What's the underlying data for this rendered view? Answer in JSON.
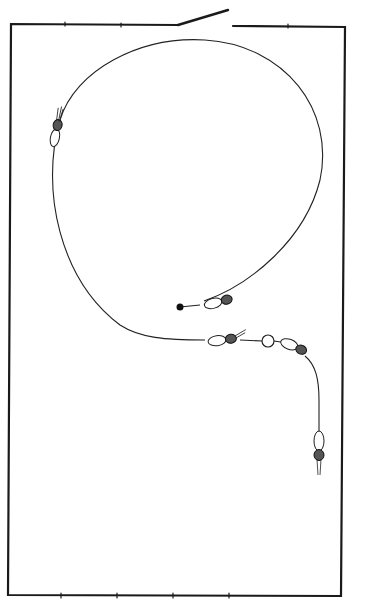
{
  "diagram": {
    "colors": {
      "background": "#ffffff",
      "stroke": "#1a1a1a",
      "fill": "#111111"
    },
    "frame": {
      "left": 10,
      "top": 24,
      "right": 345,
      "bottom": 595
    },
    "switch": {
      "pivot_x": 178,
      "pivot_y": 25,
      "tip_x": 228,
      "tip_y": 10,
      "gap_end_x": 233
    },
    "loop": {
      "cx": 187,
      "cy": 180,
      "rx": 140,
      "ry": 172
    },
    "ring": {
      "cx": 268,
      "cy": 341,
      "r": 6
    },
    "end_bead": {
      "cx": 180,
      "cy": 307,
      "r": 3.5
    }
  }
}
